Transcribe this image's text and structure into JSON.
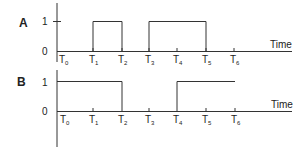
{
  "diagram": {
    "type": "timing-diagram",
    "axis_label": "Time",
    "level_labels": [
      "0",
      "1"
    ],
    "time_marks": [
      {
        "label": "T",
        "sub": "0",
        "x": 57
      },
      {
        "label": "T",
        "sub": "1",
        "x": 93
      },
      {
        "label": "T",
        "sub": "2",
        "x": 122
      },
      {
        "label": "T",
        "sub": "3",
        "x": 149
      },
      {
        "label": "T",
        "sub": "4",
        "x": 177
      },
      {
        "label": "T",
        "sub": "5",
        "x": 206
      },
      {
        "label": "T",
        "sub": "6",
        "x": 234
      }
    ],
    "signals": [
      {
        "name": "A",
        "high_intervals": [
          [
            "T1",
            "T2"
          ],
          [
            "T3",
            "T5"
          ]
        ],
        "description": "High from T1 to T2 and from T3 to T5, low otherwise"
      },
      {
        "name": "B",
        "high_intervals": [
          [
            "T0",
            "T2"
          ],
          [
            "T4",
            "T6"
          ]
        ],
        "description": "High from T0 to T2, low from T2 to T4, high from T4 to T6"
      }
    ],
    "colors": {
      "line": "#333333",
      "text": "#222222",
      "background": "#ffffff"
    }
  }
}
